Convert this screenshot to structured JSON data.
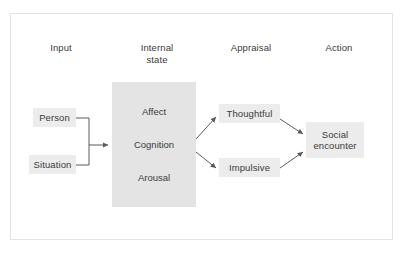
{
  "figure": {
    "columns": [
      {
        "id": "input",
        "label": "Input"
      },
      {
        "id": "internal-state",
        "label": "Internal\nstate"
      },
      {
        "id": "appraisal",
        "label": "Appraisal"
      },
      {
        "id": "action",
        "label": "Action"
      }
    ],
    "input_nodes": [
      {
        "id": "person",
        "label": "Person"
      },
      {
        "id": "situation",
        "label": "Situation"
      }
    ],
    "internal_state": {
      "id": "internal-state-block",
      "items": [
        {
          "id": "affect",
          "label": "Affect"
        },
        {
          "id": "cognition",
          "label": "Cognition"
        },
        {
          "id": "arousal",
          "label": "Arousal"
        }
      ]
    },
    "appraisal_nodes": [
      {
        "id": "thoughtful",
        "label": "Thoughtful"
      },
      {
        "id": "impulsive",
        "label": "Impulsive"
      }
    ],
    "action_nodes": [
      {
        "id": "social-encounter",
        "label": "Social encounter"
      }
    ],
    "colors": {
      "block_fill": "#e4e4e4",
      "node_fill": "#ececec",
      "text": "#3b3b3b",
      "connector": "#5a5a5a",
      "frame_border": "#e3e3e3",
      "background": "#ffffff"
    }
  }
}
